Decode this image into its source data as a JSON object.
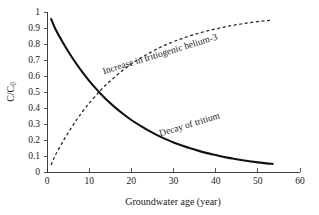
{
  "chart_data": {
    "type": "line",
    "title": "",
    "subtitle": "",
    "xlabel": "Groundwater age (year)",
    "ylabel": "C/C₀",
    "xlim": [
      0,
      60
    ],
    "ylim": [
      0,
      1
    ],
    "xticks": [
      "0",
      "10",
      "20",
      "30",
      "40",
      "50",
      "60"
    ],
    "yticks": [
      "0",
      "0.1",
      "0.2",
      "0.3",
      "0.4",
      "0.5",
      "0.6",
      "0.7",
      "0.8",
      "0.9",
      "1"
    ],
    "grid": false,
    "legend_position": "inline-annotations",
    "annotations": [
      {
        "name": "helium-3-curve-label",
        "text": "Increase in tritiogenic helium-3",
        "x": 27,
        "y": 0.72,
        "rotation": -17
      },
      {
        "name": "tritium-curve-label",
        "text": "Decay of tritium",
        "x": 34,
        "y": 0.28,
        "rotation": -17
      }
    ],
    "x": [
      1,
      2,
      4,
      6,
      8,
      10,
      12,
      12.32,
      14,
      16,
      18,
      20,
      22,
      24,
      26,
      28,
      30,
      32,
      34,
      36,
      38,
      40,
      42,
      44,
      46,
      48,
      50,
      52,
      53.5
    ],
    "series": [
      {
        "name": "Decay of tritium",
        "style": "solid",
        "color": "#111111",
        "values": [
          0.956,
          0.894,
          0.799,
          0.714,
          0.638,
          0.57,
          0.51,
          0.5,
          0.455,
          0.407,
          0.364,
          0.325,
          0.291,
          0.26,
          0.232,
          0.207,
          0.185,
          0.166,
          0.148,
          0.132,
          0.118,
          0.106,
          0.094,
          0.084,
          0.075,
          0.067,
          0.06,
          0.054,
          0.051
        ]
      },
      {
        "name": "Increase in tritiogenic helium-3",
        "style": "dashed",
        "color": "#222222",
        "values": [
          0.044,
          0.106,
          0.201,
          0.286,
          0.362,
          0.43,
          0.49,
          0.5,
          0.545,
          0.593,
          0.636,
          0.675,
          0.709,
          0.74,
          0.768,
          0.793,
          0.815,
          0.834,
          0.852,
          0.868,
          0.882,
          0.894,
          0.906,
          0.916,
          0.925,
          0.933,
          0.94,
          0.946,
          0.949
        ]
      }
    ]
  },
  "axis": {
    "x_title": "Groundwater age (year)",
    "y_title_main": "C/C",
    "y_title_sub": "0"
  }
}
